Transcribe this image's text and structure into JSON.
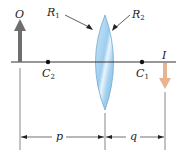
{
  "diagram": {
    "type": "thin lens ray geometry",
    "labels": {
      "object": "O",
      "image": "I",
      "radius1": "R",
      "radius1_sub": "1",
      "radius2": "R",
      "radius2_sub": "2",
      "center2": "C",
      "center2_sub": "2",
      "center1": "C",
      "center1_sub": "1",
      "object_distance": "p",
      "image_distance": "q"
    },
    "colors": {
      "object_arrow": "#6e6e6e",
      "image_arrow": "#e8b48f",
      "lens_fill": "#a8d4f0",
      "lens_edge": "#6fa8d0",
      "axis": "#333333"
    }
  }
}
